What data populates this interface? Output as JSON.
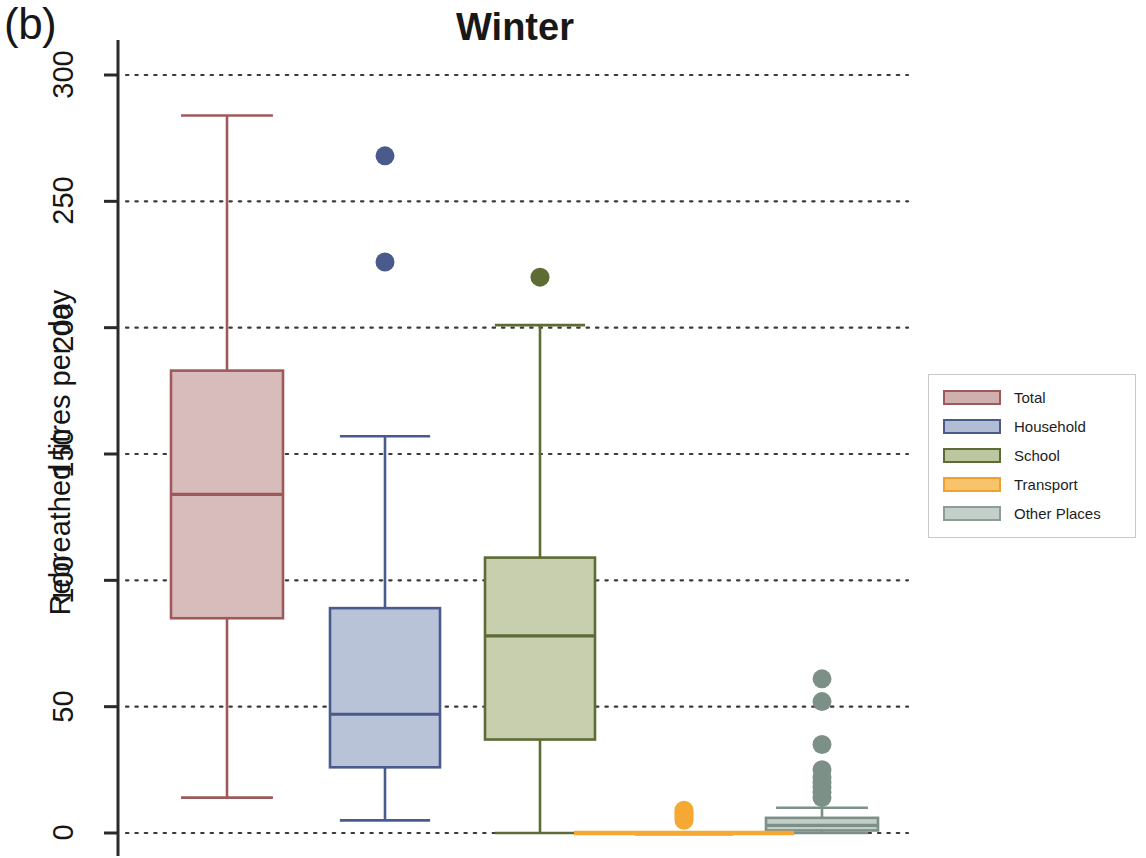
{
  "panel": {
    "label": "(b)"
  },
  "chart_data": {
    "type": "box",
    "title": "Winter",
    "xlabel": "",
    "ylabel": "Rebreathed litres per day",
    "ylim": [
      0,
      310
    ],
    "yticks": [
      0,
      50,
      100,
      150,
      200,
      250,
      300
    ],
    "ytick_labels": [
      "0",
      "50",
      "100",
      "150",
      "200",
      "250",
      "300"
    ],
    "grid": "horizontal-dotted",
    "legend_position": "right",
    "categories": [
      "Total",
      "Household",
      "School",
      "Transport",
      "Other Places"
    ],
    "series": [
      {
        "name": "Total",
        "color": "#9e5a5a",
        "fill": "#d8bcbb",
        "whisker_low": 14,
        "q1": 85,
        "median": 134,
        "q3": 183,
        "whisker_high": 284,
        "outliers": []
      },
      {
        "name": "Household",
        "color": "#4a5a8c",
        "fill": "#b9c3d8",
        "whisker_low": 5,
        "q1": 26,
        "median": 47,
        "q3": 89,
        "whisker_high": 157,
        "outliers": [
          268,
          226
        ]
      },
      {
        "name": "School",
        "color": "#5d6b34",
        "fill": "#c8cfae",
        "whisker_low": 0,
        "q1": 37,
        "median": 78,
        "q3": 109,
        "whisker_high": 201,
        "outliers": [
          220
        ]
      },
      {
        "name": "Transport",
        "color": "#f5a833",
        "fill": "#f7c46a",
        "whisker_low": 0,
        "q1": 0,
        "median": 0,
        "q3": 0,
        "whisker_high": 0,
        "outliers": [
          9,
          8,
          7,
          6,
          5
        ]
      },
      {
        "name": "Other Places",
        "color": "#7c9088",
        "fill": "#c3cec8",
        "whisker_low": 0,
        "q1": 1,
        "median": 3,
        "q3": 6,
        "whisker_high": 10,
        "outliers": [
          61,
          52,
          35,
          25,
          22,
          20,
          18,
          16,
          14
        ]
      }
    ],
    "legend": [
      {
        "label": "Total",
        "color": "#9e5a5a",
        "fill": "#d0b0ae"
      },
      {
        "label": "Household",
        "color": "#4a5a8c",
        "fill": "#b0bdd4"
      },
      {
        "label": "School",
        "color": "#5d6b34",
        "fill": "#bcc79f"
      },
      {
        "label": "Transport",
        "color": "#f0a02e",
        "fill": "#f8c46b"
      },
      {
        "label": "Other Places",
        "color": "#8c9d96",
        "fill": "#c4cfc9"
      }
    ]
  }
}
